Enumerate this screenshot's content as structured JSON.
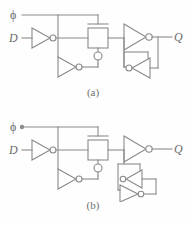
{
  "figure": {
    "type": "logic-circuit-schematic",
    "line_color": "#8a8a8a",
    "text_color": "#6a6a6a",
    "background_color": "#fefefe"
  },
  "circuits": [
    {
      "id": "a",
      "caption": "(a)",
      "labels": {
        "clock": "ϕ",
        "data": "D",
        "output": "Q"
      },
      "components": [
        {
          "name": "clock-input-port",
          "type": "port",
          "label": "ϕ"
        },
        {
          "name": "data-input-port",
          "type": "port",
          "label": "D"
        },
        {
          "name": "input-inverter",
          "type": "inverter",
          "direction": "right"
        },
        {
          "name": "clock-inverter",
          "type": "inverter",
          "direction": "right"
        },
        {
          "name": "transmission-gate",
          "type": "transmission-gate",
          "nmos_gate": "clock-bar",
          "pmos_gate": "clock"
        },
        {
          "name": "output-inverter",
          "type": "inverter",
          "direction": "right"
        },
        {
          "name": "feedback-inverter",
          "type": "inverter",
          "direction": "left"
        },
        {
          "name": "output-port",
          "type": "port",
          "label": "Q"
        }
      ],
      "feedback_inverter_count": 1
    },
    {
      "id": "b",
      "caption": "(b)",
      "labels": {
        "clock": "ϕ",
        "data": "D",
        "output": "Q"
      },
      "components": [
        {
          "name": "clock-input-port",
          "type": "port",
          "label": "ϕ"
        },
        {
          "name": "data-input-port",
          "type": "port",
          "label": "D"
        },
        {
          "name": "input-inverter",
          "type": "inverter",
          "direction": "right"
        },
        {
          "name": "clock-inverter",
          "type": "inverter",
          "direction": "right"
        },
        {
          "name": "transmission-gate",
          "type": "transmission-gate",
          "nmos_gate": "clock-bar",
          "pmos_gate": "clock"
        },
        {
          "name": "output-inverter",
          "type": "inverter",
          "direction": "right"
        },
        {
          "name": "feedback-inverter-upper",
          "type": "inverter",
          "direction": "left"
        },
        {
          "name": "feedback-inverter-lower",
          "type": "inverter",
          "direction": "right"
        },
        {
          "name": "output-port",
          "type": "port",
          "label": "Q"
        }
      ],
      "feedback_inverter_count": 2
    }
  ]
}
